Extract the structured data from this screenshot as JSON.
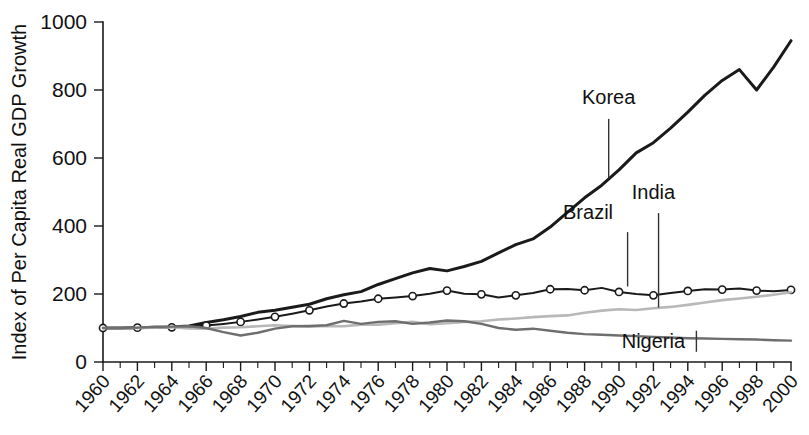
{
  "chart_data": {
    "type": "line",
    "title": "",
    "xlabel": "",
    "ylabel": "Index of Per Capita Real GDP Growth",
    "xlim": [
      1960,
      2000
    ],
    "ylim": [
      0,
      1000
    ],
    "yticks": [
      0,
      200,
      400,
      600,
      800,
      1000
    ],
    "ytick_labels": [
      "0",
      "200",
      "400",
      "600",
      "800",
      "1000"
    ],
    "grid": false,
    "legend_position": "inline-annotations",
    "x": [
      1960,
      1961,
      1962,
      1963,
      1964,
      1965,
      1966,
      1967,
      1968,
      1969,
      1970,
      1971,
      1972,
      1973,
      1974,
      1975,
      1976,
      1977,
      1978,
      1979,
      1980,
      1981,
      1982,
      1983,
      1984,
      1985,
      1986,
      1987,
      1988,
      1989,
      1990,
      1991,
      1992,
      1993,
      1994,
      1995,
      1996,
      1997,
      1998,
      1999,
      2000
    ],
    "xtick_labels": [
      "1960",
      "1962",
      "1964",
      "1966",
      "1968",
      "1970",
      "1972",
      "1974",
      "1976",
      "1978",
      "1980",
      "1982",
      "1984",
      "1986",
      "1988",
      "1990",
      "1992",
      "1994",
      "1996",
      "1998",
      "2000"
    ],
    "series": [
      {
        "name": "Korea",
        "color": "#1a1a1a",
        "width": 3.0,
        "markers": false,
        "values": [
          100,
          100,
          101,
          102,
          103,
          106,
          116,
          124,
          134,
          146,
          152,
          161,
          170,
          186,
          198,
          207,
          228,
          245,
          262,
          275,
          268,
          281,
          296,
          321,
          345,
          362,
          397,
          440,
          483,
          520,
          565,
          615,
          645,
          688,
          735,
          785,
          828,
          860,
          800,
          868,
          945
        ]
      },
      {
        "name": "Brazil",
        "color": "#1a1a1a",
        "width": 2.0,
        "markers": true,
        "values": [
          100,
          100,
          101,
          101,
          102,
          103,
          107,
          112,
          118,
          125,
          133,
          142,
          152,
          163,
          172,
          178,
          186,
          190,
          194,
          201,
          210,
          201,
          199,
          190,
          196,
          203,
          214,
          215,
          211,
          218,
          206,
          200,
          196,
          203,
          209,
          214,
          213,
          216,
          210,
          208,
          212
        ]
      },
      {
        "name": "India",
        "color": "#b8b8b8",
        "width": 2.6,
        "markers": false,
        "values": [
          100,
          100,
          100,
          101,
          102,
          99,
          98,
          101,
          102,
          105,
          108,
          106,
          104,
          106,
          105,
          110,
          110,
          114,
          118,
          111,
          114,
          118,
          120,
          125,
          128,
          132,
          135,
          137,
          145,
          151,
          155,
          153,
          158,
          162,
          168,
          175,
          182,
          187,
          192,
          198,
          205
        ]
      },
      {
        "name": "Nigeria",
        "color": "#6e6e6e",
        "width": 2.4,
        "markers": false,
        "values": [
          100,
          100,
          101,
          103,
          104,
          105,
          100,
          88,
          78,
          86,
          98,
          105,
          106,
          108,
          121,
          112,
          118,
          120,
          112,
          116,
          122,
          120,
          112,
          100,
          95,
          98,
          92,
          86,
          82,
          80,
          78,
          76,
          74,
          72,
          70,
          69,
          68,
          67,
          66,
          64,
          63
        ]
      }
    ],
    "annotations": [
      {
        "label": "Korea",
        "label_x": 1989.4,
        "label_y": 760,
        "leader_from_y": 715,
        "leader_to_y": 540,
        "leader_x": 1989.4
      },
      {
        "label": "Brazil",
        "label_x": 1988.2,
        "label_y": 420,
        "leader_from_y": 382,
        "leader_to_y": 222,
        "leader_x": 1990.5
      },
      {
        "label": "India",
        "label_x": 1992.0,
        "label_y": 478,
        "leader_from_y": 438,
        "leader_to_y": 160,
        "leader_x": 1992.3
      },
      {
        "label": "Nigeria",
        "label_x": 1992.0,
        "label_y": 40,
        "leader_from_y": 30,
        "leader_to_y": 92,
        "leader_x": 1994.5
      }
    ]
  }
}
